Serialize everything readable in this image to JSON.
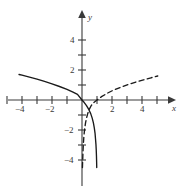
{
  "chart_data": {
    "type": "line",
    "title": "",
    "xlabel": "x",
    "ylabel": "y",
    "xlim": [
      -5.4,
      5.6
    ],
    "ylim": [
      -4.8,
      5.0
    ],
    "grid": false,
    "legend": null,
    "axis_color": "#3a3a3a",
    "curve_color": "#1a1a1a",
    "xticks": [
      -4,
      -2,
      2,
      4
    ],
    "xtick_labels": [
      "−4",
      "−2",
      "2",
      "4"
    ],
    "yticks": [
      -4,
      -2,
      2,
      4
    ],
    "ytick_labels": [
      "−4",
      "−2",
      "2",
      "4"
    ],
    "minor_xticks": [
      -5,
      -3,
      -1,
      1,
      3,
      5
    ],
    "minor_yticks": [
      -3,
      -1,
      1,
      3
    ],
    "series": [
      {
        "name": "solid-curve",
        "style": "solid",
        "description": "reflected logarithmic curve through origin, vertical asymptote at x = 1",
        "points": [
          [
            -4.2,
            1.7
          ],
          [
            -4.0,
            1.66
          ],
          [
            -3.5,
            1.53
          ],
          [
            -3.0,
            1.39
          ],
          [
            -2.5,
            1.24
          ],
          [
            -2.0,
            1.08
          ],
          [
            -1.5,
            0.9
          ],
          [
            -1.0,
            0.71
          ],
          [
            -0.6,
            0.53
          ],
          [
            -0.3,
            0.38
          ],
          [
            0.0,
            0.0
          ],
          [
            0.15,
            -0.17
          ],
          [
            0.3,
            -0.38
          ],
          [
            0.45,
            -0.63
          ],
          [
            0.58,
            -0.91
          ],
          [
            0.68,
            -1.21
          ],
          [
            0.76,
            -1.53
          ],
          [
            0.82,
            -1.86
          ],
          [
            0.87,
            -2.22
          ],
          [
            0.9,
            -2.58
          ],
          [
            0.93,
            -2.96
          ],
          [
            0.95,
            -3.35
          ],
          [
            0.965,
            -3.75
          ],
          [
            0.975,
            -4.15
          ],
          [
            0.982,
            -4.5
          ]
        ]
      },
      {
        "name": "dashed-curve",
        "style": "dashed",
        "description": "logarithmic curve, x-intercept at x = 1, vertical asymptote at x = 0",
        "points": [
          [
            0.03,
            -4.5
          ],
          [
            0.04,
            -4.15
          ],
          [
            0.055,
            -3.75
          ],
          [
            0.07,
            -3.35
          ],
          [
            0.09,
            -2.96
          ],
          [
            0.115,
            -2.58
          ],
          [
            0.145,
            -2.22
          ],
          [
            0.185,
            -1.86
          ],
          [
            0.235,
            -1.53
          ],
          [
            0.3,
            -1.21
          ],
          [
            0.38,
            -0.91
          ],
          [
            0.48,
            -0.63
          ],
          [
            0.61,
            -0.38
          ],
          [
            0.78,
            -0.17
          ],
          [
            1.0,
            0.0
          ],
          [
            1.3,
            0.22
          ],
          [
            1.7,
            0.46
          ],
          [
            2.1,
            0.66
          ],
          [
            2.6,
            0.86
          ],
          [
            3.1,
            1.04
          ],
          [
            3.6,
            1.2
          ],
          [
            4.1,
            1.34
          ],
          [
            4.6,
            1.48
          ],
          [
            5.05,
            1.6
          ]
        ]
      }
    ]
  }
}
